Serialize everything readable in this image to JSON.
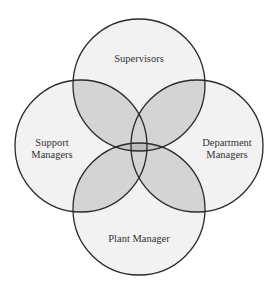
{
  "diagram": {
    "type": "venn",
    "colors": {
      "background": "#ffffff",
      "single_fill": "#f2f2f2",
      "double_overlap_fill": "#d4d4d4",
      "center_overlap_fill": "#bdbdbd",
      "stroke": "#2a2a2a"
    },
    "circles": [
      {
        "id": "supervisors",
        "label": "Supervisors",
        "cx": 139,
        "cy": 85,
        "r": 66
      },
      {
        "id": "support-managers",
        "label_line1": "Support",
        "label_line2": "Managers",
        "cx": 81,
        "cy": 146,
        "r": 66
      },
      {
        "id": "department-managers",
        "label_line1": "Department",
        "label_line2": "Managers",
        "cx": 197,
        "cy": 146,
        "r": 66
      },
      {
        "id": "plant-manager",
        "label": "Plant Manager",
        "cx": 139,
        "cy": 209,
        "r": 66
      }
    ]
  }
}
